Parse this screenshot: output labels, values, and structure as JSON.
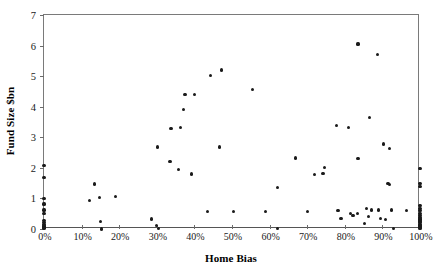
{
  "chart_data": {
    "type": "scatter",
    "title": "",
    "xlabel": "Home Bias",
    "ylabel": "Fund Size $bn",
    "xlim": [
      0,
      1
    ],
    "ylim": [
      0,
      7
    ],
    "grid": false,
    "legend": null,
    "x_tick_labels": [
      "0%",
      "10%",
      "20%",
      "30%",
      "40%",
      "50%",
      "60%",
      "70%",
      "80%",
      "90%",
      "100%"
    ],
    "x_tick_values": [
      0,
      0.1,
      0.2,
      0.3,
      0.4,
      0.5,
      0.6,
      0.7,
      0.8,
      0.9,
      1.0
    ],
    "y_tick_labels": [
      "0",
      "1",
      "2",
      "3",
      "4",
      "5",
      "6",
      "7"
    ],
    "y_tick_values": [
      0,
      1,
      2,
      3,
      4,
      5,
      6,
      7
    ],
    "marker": "filled-circle",
    "marker_color": "#1a1a1a",
    "points": [
      [
        0.0,
        2.07
      ],
      [
        0.0,
        1.68
      ],
      [
        0.0,
        1.0
      ],
      [
        0.0,
        0.82
      ],
      [
        0.0,
        0.62
      ],
      [
        0.0,
        0.5
      ],
      [
        0.0,
        0.28
      ],
      [
        0.0,
        0.2
      ],
      [
        0.0,
        0.14
      ],
      [
        0.0,
        0.1
      ],
      [
        0.0,
        0.06
      ],
      [
        0.0,
        0.03
      ],
      [
        0.12,
        0.92
      ],
      [
        0.135,
        1.47
      ],
      [
        0.148,
        1.02
      ],
      [
        0.15,
        0.25
      ],
      [
        0.153,
        0.0
      ],
      [
        0.19,
        1.05
      ],
      [
        0.285,
        0.33
      ],
      [
        0.3,
        0.12
      ],
      [
        0.305,
        0.02
      ],
      [
        0.302,
        2.68
      ],
      [
        0.335,
        2.2
      ],
      [
        0.338,
        3.3
      ],
      [
        0.372,
        3.9
      ],
      [
        0.375,
        4.4
      ],
      [
        0.4,
        4.4
      ],
      [
        0.392,
        1.8
      ],
      [
        0.362,
        3.32
      ],
      [
        0.357,
        1.95
      ],
      [
        0.435,
        0.58
      ],
      [
        0.442,
        5.02
      ],
      [
        0.467,
        2.68
      ],
      [
        0.472,
        5.2
      ],
      [
        0.505,
        0.58
      ],
      [
        0.555,
        4.55
      ],
      [
        0.59,
        0.57
      ],
      [
        0.62,
        1.35
      ],
      [
        0.622,
        0.02
      ],
      [
        0.668,
        2.32
      ],
      [
        0.7,
        0.58
      ],
      [
        0.72,
        1.78
      ],
      [
        0.742,
        1.82
      ],
      [
        0.745,
        2.02
      ],
      [
        0.778,
        3.38
      ],
      [
        0.782,
        0.6
      ],
      [
        0.79,
        0.35
      ],
      [
        0.81,
        3.32
      ],
      [
        0.815,
        0.52
      ],
      [
        0.822,
        0.45
      ],
      [
        0.833,
        0.52
      ],
      [
        0.835,
        2.3
      ],
      [
        0.852,
        0.18
      ],
      [
        0.858,
        0.68
      ],
      [
        0.862,
        0.42
      ],
      [
        0.865,
        3.65
      ],
      [
        0.872,
        0.62
      ],
      [
        0.888,
        5.72
      ],
      [
        0.89,
        0.62
      ],
      [
        0.895,
        0.34
      ],
      [
        0.902,
        2.78
      ],
      [
        0.908,
        0.3
      ],
      [
        0.918,
        2.62
      ],
      [
        0.915,
        1.5
      ],
      [
        0.918,
        1.45
      ],
      [
        0.925,
        0.62
      ],
      [
        0.93,
        0.02
      ],
      [
        0.835,
        6.05
      ],
      [
        0.965,
        0.6
      ],
      [
        1.0,
        1.98
      ],
      [
        1.0,
        1.5
      ],
      [
        1.0,
        1.38
      ],
      [
        1.0,
        0.78
      ],
      [
        1.0,
        0.68
      ],
      [
        1.0,
        0.6
      ],
      [
        1.0,
        0.52
      ],
      [
        1.0,
        0.44
      ],
      [
        1.0,
        0.38
      ],
      [
        1.0,
        0.33
      ],
      [
        1.0,
        0.28
      ],
      [
        1.0,
        0.24
      ],
      [
        1.0,
        0.2
      ],
      [
        1.0,
        0.16
      ],
      [
        1.0,
        0.12
      ],
      [
        1.0,
        0.08
      ],
      [
        1.0,
        0.05
      ],
      [
        1.0,
        0.02
      ]
    ]
  }
}
